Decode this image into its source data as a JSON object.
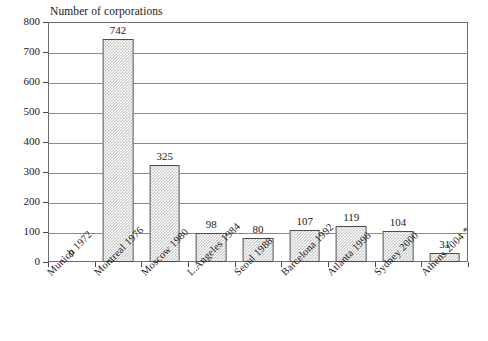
{
  "chart_data": {
    "type": "bar",
    "title": "",
    "ylabel": "Number of corporations",
    "xlabel": "",
    "ylim": [
      0,
      800
    ],
    "yticks": [
      0,
      100,
      200,
      300,
      400,
      500,
      600,
      700,
      800
    ],
    "grid": true,
    "legend": false,
    "categories": [
      "Munich 1972",
      "Montreal 1976",
      "Moscow 1980",
      "L.Angeles 1984",
      "Seoul 1988",
      "Barcelona 1992",
      "Atlanta 1996",
      "Sydney 2000",
      "Athens 2004 *"
    ],
    "values": [
      0,
      742,
      325,
      98,
      80,
      107,
      119,
      104,
      31
    ],
    "value_labels": [
      "0",
      "742",
      "325",
      "98",
      "80",
      "107",
      "119",
      "104",
      "31"
    ],
    "footnote_marker": "*",
    "bar_fill": "#b9b9b9",
    "bar_border": "#4d4d4d",
    "grid_color": "#8a8a8a",
    "frame_color": "#6d6d6d"
  },
  "axis": {
    "y_title": "Number of corporations",
    "tick_labels": [
      "800",
      "700",
      "600",
      "500",
      "400",
      "300",
      "200",
      "100",
      "0"
    ]
  }
}
